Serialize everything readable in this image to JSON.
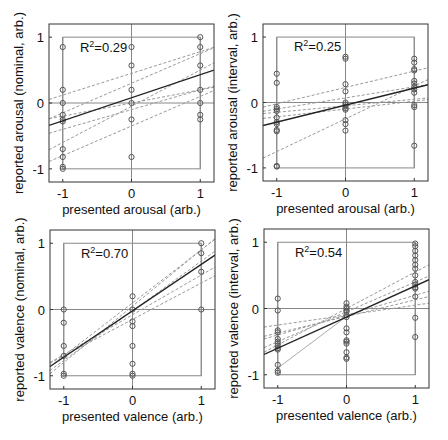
{
  "figure": {
    "background": "#ffffff",
    "axis_color": "#333333",
    "gray_color": "#888888",
    "dashed_color": "#999999",
    "fit_color": "#222222",
    "marker_color": "#555555"
  },
  "chart_data": [
    {
      "type": "scatter",
      "id": "top-left",
      "xlabel": "presented arousal (arb.)",
      "ylabel": "reported arousal (nominal, arb.)",
      "annotation": "R2=0.29",
      "r2": "0.29",
      "xlim": [
        -1.2,
        1.2
      ],
      "ylim": [
        -1.2,
        1.2
      ],
      "xticks": [
        -1,
        0,
        1
      ],
      "yticks": [
        -1,
        0,
        1
      ],
      "box_px": [
        49,
        24,
        214,
        182
      ],
      "points": {
        "-1": [
          0.85,
          0.2,
          0.0,
          -0.18,
          -0.25,
          -0.28,
          -0.7,
          -0.82,
          -0.97,
          -1.0
        ],
        "0": [
          0.85,
          0.57,
          0.2,
          0.0,
          -0.25,
          -0.82
        ],
        "1": [
          1.0,
          0.85,
          0.57,
          0.2,
          0.0,
          -0.18,
          -0.25
        ]
      },
      "fit": {
        "slope": 0.35,
        "intercept": 0.08
      },
      "dashed": [
        {
          "slope": 0.33,
          "intercept": 0.45
        },
        {
          "slope": 0.45,
          "intercept": 0.3
        },
        {
          "slope": 0.3,
          "intercept": -0.1
        },
        {
          "slope": 0.55,
          "intercept": -0.05
        },
        {
          "slope": 0.2,
          "intercept": 0.0
        },
        {
          "slope": 0.45,
          "intercept": -0.35
        }
      ]
    },
    {
      "type": "scatter",
      "id": "top-right",
      "xlabel": "presented arousal (arb.)",
      "ylabel": "reported arousal (interval, arb.)",
      "annotation": "R2=0.25",
      "r2": "0.25",
      "xlim": [
        -1.2,
        1.2
      ],
      "ylim": [
        -1.2,
        1.2
      ],
      "xticks": [
        -1,
        0,
        1
      ],
      "yticks": [
        -1,
        0,
        1
      ],
      "box_px": [
        263,
        24,
        428,
        181
      ],
      "points": {
        "-1": [
          0.44,
          0.3,
          -0.07,
          -0.1,
          -0.13,
          -0.23,
          -0.3,
          -0.33,
          -0.42,
          -0.44,
          -0.97,
          -0.98
        ],
        "0": [
          0.7,
          0.67,
          0.28,
          0.17,
          0.0,
          -0.03,
          -0.06,
          -0.09,
          -0.11,
          -0.27,
          -0.33,
          -0.43
        ],
        "1": [
          0.67,
          0.61,
          0.51,
          0.49,
          0.33,
          0.29,
          0.24,
          0.2,
          0.15,
          -0.04,
          -0.07,
          -0.66
        ]
      },
      "fit": {
        "slope": 0.26,
        "intercept": -0.04
      },
      "dashed": [
        {
          "slope": 0.25,
          "intercept": 0.23
        },
        {
          "slope": 0.17,
          "intercept": 0.07
        },
        {
          "slope": 0.1,
          "intercept": -0.05
        },
        {
          "slope": 0.12,
          "intercept": -0.1
        },
        {
          "slope": 0.5,
          "intercept": -0.25
        }
      ]
    },
    {
      "type": "scatter",
      "id": "bottom-left",
      "xlabel": "presented valence (arb.)",
      "ylabel": "reported valence (nominal, arb.)",
      "annotation": "R2=0.70",
      "r2": "0.70",
      "xlim": [
        -1.2,
        1.2
      ],
      "ylim": [
        -1.2,
        1.2
      ],
      "xticks": [
        -1,
        0,
        1
      ],
      "yticks": [
        -1,
        0,
        1
      ],
      "box_px": [
        50,
        230,
        215,
        389
      ],
      "points": {
        "-1": [
          0.0,
          -0.2,
          -0.55,
          -0.7,
          -0.97,
          -1.0
        ],
        "0": [
          0.2,
          0.0,
          -0.18,
          -0.25,
          -0.55,
          -0.82,
          -0.97,
          -1.0
        ],
        "1": [
          1.0,
          0.85,
          0.57,
          0.0
        ]
      },
      "fit": {
        "slope": 0.7,
        "intercept": -0.02
      },
      "dashed": [
        {
          "slope": 0.8,
          "intercept": 0.1
        },
        {
          "slope": 0.85,
          "intercept": 0.05
        },
        {
          "slope": 0.75,
          "intercept": -0.02
        },
        {
          "slope": 0.55,
          "intercept": -0.15
        },
        {
          "slope": 0.6,
          "intercept": -0.08
        }
      ]
    },
    {
      "type": "scatter",
      "id": "bottom-right",
      "xlabel": "presented valence (arb.)",
      "ylabel": "reported valence (interval, arb.)",
      "annotation": "R2=0.54",
      "r2": "0.54",
      "xlim": [
        -1.2,
        1.2
      ],
      "ylim": [
        -1.2,
        1.2
      ],
      "xticks": [
        -1,
        0,
        1
      ],
      "yticks": [
        -1,
        0,
        1
      ],
      "box_px": [
        264,
        229,
        429,
        388
      ],
      "points": {
        "-1": [
          0.15,
          -0.03,
          -0.33,
          -0.36,
          -0.46,
          -0.5,
          -0.53,
          -0.56,
          -0.6,
          -0.62,
          -0.85,
          -0.94,
          -0.97
        ],
        "0": [
          0.08,
          0.03,
          0.0,
          -0.03,
          -0.05,
          -0.1,
          -0.13,
          -0.3,
          -0.36,
          -0.48,
          -0.5,
          -0.53,
          -0.66,
          -0.74,
          -0.76
        ],
        "1": [
          0.98,
          0.94,
          0.87,
          0.8,
          0.73,
          0.66,
          0.6,
          0.5,
          0.4,
          0.36,
          0.32,
          0.3,
          0.18,
          -0.14,
          -0.43
        ]
      },
      "fit": {
        "slope": 0.47,
        "intercept": -0.13
      },
      "dashed": [
        {
          "slope": 0.55,
          "intercept": 0.0
        },
        {
          "slope": 0.45,
          "intercept": -0.05
        },
        {
          "slope": 0.3,
          "intercept": -0.1
        },
        {
          "slope": 0.25,
          "intercept": -0.12
        },
        {
          "slope": 0.15,
          "intercept": -0.1
        }
      ],
      "dotted_segment": {
        "x": [
          -1,
          0
        ],
        "y": [
          -0.9,
          -0.12
        ]
      }
    }
  ]
}
